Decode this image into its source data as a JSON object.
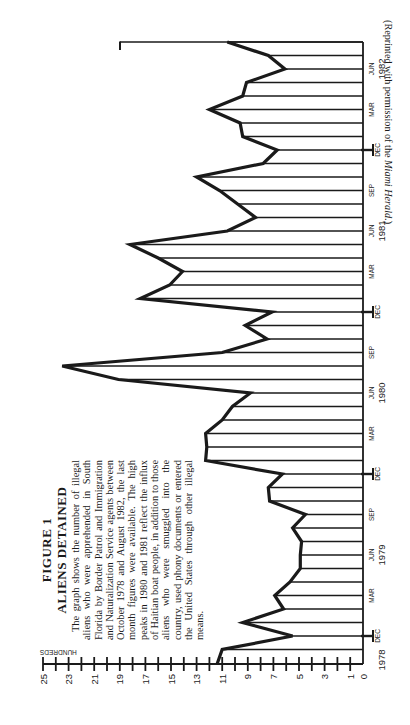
{
  "figure": {
    "label": "FIGURE 1",
    "title": "ALIENS DETAINED",
    "caption": "The graph shows the number of illegal aliens who were apprehended in South Florida by Border Patrol and Immigration and Naturalization Service agents between October 1978 and August 1982, the last month figures were available. The high peaks in 1980 and 1981 reflect the influx of Haitian boat people, in addition to those aliens who were smuggled into the country, used phony documents or entered the United States through other illegal means.",
    "credit": "(Reprinted with permission of the Miami Herald.)"
  },
  "chart_data": {
    "type": "line",
    "title": "ALIENS DETAINED",
    "orientation": "rotated 90° counter-clockwise (time runs bottom-to-top, value axis horizontal with 0 at right)",
    "xlabel": "Month (Oct 1978 – Aug 1982)",
    "ylabel": "HUNDREDS",
    "ylim": [
      0,
      25
    ],
    "y_ticks": [
      0,
      1,
      3,
      5,
      7,
      9,
      11,
      13,
      15,
      17,
      19,
      21,
      23,
      25
    ],
    "y_tick_marks_every": 1,
    "grid": "horizontal line from baseline to curve at every month",
    "x_tick_labels": [
      {
        "label": "DEC",
        "year": "1978",
        "index": 2
      },
      {
        "label": "MAR",
        "index": 5
      },
      {
        "label": "JUN",
        "year": "1979",
        "index": 8
      },
      {
        "label": "SEP",
        "index": 11
      },
      {
        "label": "DEC",
        "index": 14
      },
      {
        "label": "MAR",
        "index": 17
      },
      {
        "label": "JUN",
        "year": "1980",
        "index": 20
      },
      {
        "label": "SEP",
        "index": 23
      },
      {
        "label": "DEC",
        "index": 26
      },
      {
        "label": "MAR",
        "index": 29
      },
      {
        "label": "JUN",
        "year": "1981",
        "index": 32
      },
      {
        "label": "SEP",
        "index": 35
      },
      {
        "label": "DEC",
        "index": 38
      },
      {
        "label": "MAR",
        "index": 41
      },
      {
        "label": "JUN",
        "year": "1982",
        "index": 44
      }
    ],
    "categories": [
      "Oct 1978",
      "Nov 1978",
      "Dec 1978",
      "Jan 1979",
      "Feb 1979",
      "Mar 1979",
      "Apr 1979",
      "May 1979",
      "Jun 1979",
      "Jul 1979",
      "Aug 1979",
      "Sep 1979",
      "Oct 1979",
      "Nov 1979",
      "Dec 1979",
      "Jan 1980",
      "Feb 1980",
      "Mar 1980",
      "Apr 1980",
      "May 1980",
      "Jun 1980",
      "Jul 1980",
      "Aug 1980",
      "Sep 1980",
      "Oct 1980",
      "Nov 1980",
      "Dec 1980",
      "Jan 1981",
      "Feb 1981",
      "Mar 1981",
      "Apr 1981",
      "May 1981",
      "Jun 1981",
      "Jul 1981",
      "Aug 1981",
      "Sep 1981",
      "Oct 1981",
      "Nov 1981",
      "Dec 1981",
      "Jan 1982",
      "Feb 1982",
      "Mar 1982",
      "Apr 1982",
      "May 1982",
      "Jun 1982",
      "Jul 1982",
      "Aug 1982"
    ],
    "values": [
      11.4,
      11.0,
      5.5,
      9.4,
      6.2,
      6.9,
      5.7,
      4.9,
      4.9,
      4.8,
      5.5,
      4.5,
      7.3,
      7.4,
      6.3,
      12.3,
      12.2,
      12.3,
      11.0,
      10.2,
      8.8,
      19.1,
      23.5,
      11.0,
      7.5,
      9.2,
      7.1,
      17.4,
      15.1,
      14.1,
      16.0,
      18.2,
      10.6,
      8.4,
      9.8,
      11.2,
      13.0,
      7.8,
      6.7,
      9.4,
      9.6,
      12.0,
      9.4,
      9.1,
      6.1,
      7.4,
      10.6
    ],
    "units": "hundreds of aliens"
  },
  "axis": {
    "unit_label": "HUNDREDS",
    "value_labels": [
      "0",
      "1",
      "3",
      "5",
      "7",
      "9",
      "11",
      "13",
      "15",
      "17",
      "19",
      "21",
      "23",
      "25"
    ],
    "month_labels": [
      "DEC",
      "MAR",
      "JUN",
      "SEP",
      "DEC",
      "MAR",
      "JUN",
      "SEP",
      "DEC",
      "MAR",
      "JUN",
      "SEP",
      "DEC",
      "MAR",
      "JUN"
    ],
    "year_labels": [
      "1978",
      "1979",
      "1980",
      "1981",
      "1982"
    ]
  },
  "colors": {
    "ink": "#1a1a1a",
    "paper": "#ffffff"
  }
}
